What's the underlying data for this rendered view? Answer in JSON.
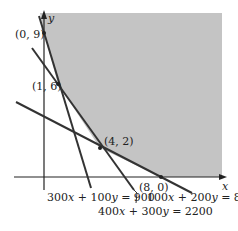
{
  "figure": {
    "type": "linear-programming-feasible-region",
    "colors": {
      "region": "#c4c4c4",
      "lines": "#333333",
      "axes": "#222222",
      "background": "#ffffff"
    },
    "axes": {
      "x_label": "x",
      "y_label": "y"
    },
    "points": [
      {
        "id": "p09",
        "label": "(0, 9)",
        "x": 0,
        "y": 9
      },
      {
        "id": "p16",
        "label": "(1, 6)",
        "x": 1,
        "y": 6
      },
      {
        "id": "p42",
        "label": "(4, 2)",
        "x": 4,
        "y": 2
      },
      {
        "id": "p80",
        "label": "(8, 0)",
        "x": 8,
        "y": 0
      }
    ],
    "lines": [
      {
        "id": "l1",
        "label": "300x + 100y = 900",
        "label_parts": [
          "300",
          "x",
          " + 100",
          "y",
          " = 900"
        ]
      },
      {
        "id": "l2",
        "label": "400x + 300y = 2200",
        "label_parts": [
          "400",
          "x",
          " + 300",
          "y",
          " = 2200"
        ]
      },
      {
        "id": "l3",
        "label": "100x + 200y = 800",
        "label_parts": [
          "100",
          "x",
          " + 200",
          "y",
          " = 800"
        ]
      }
    ]
  }
}
